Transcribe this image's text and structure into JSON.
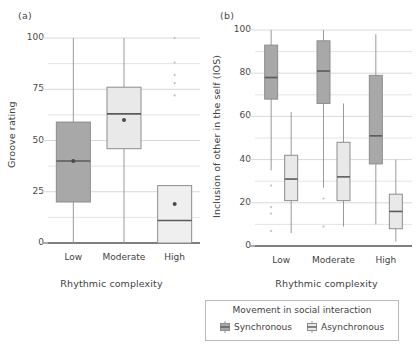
{
  "figure": {
    "panels": [
      {
        "label": "(a)",
        "ylabel": "Groove rating",
        "xlabel": "Rhythmic complexity"
      },
      {
        "label": "(b)",
        "ylabel": "Inclusion of other in the self (IOS)",
        "xlabel": "Rhythmic complexity"
      }
    ]
  },
  "legend": {
    "title": "Movement in social interaction",
    "entries": [
      {
        "label": "Synchronous",
        "color": "#a8a8a8"
      },
      {
        "label": "Asynchronous",
        "color": "#e8e8e8"
      }
    ]
  },
  "colors": {
    "synchronous_fill": "#a8a8a8",
    "asynchronous_fill": "#e9e9e9",
    "box_stroke": "#8d8d8d",
    "median_stroke": "#5a5a5a",
    "whisker_stroke": "#9a9a9a",
    "grid": "#d9d9d9",
    "axis": "#555555"
  },
  "chart_data": [
    {
      "type": "box",
      "panel": "(a)",
      "title": "",
      "xlabel": "Rhythmic complexity",
      "ylabel": "Groove rating",
      "categories": [
        "Low",
        "Moderate",
        "High"
      ],
      "ylim": [
        0,
        100
      ],
      "yticks": [
        0,
        25,
        50,
        75,
        100
      ],
      "ytick_labels": [
        "0",
        "25",
        "50",
        "75",
        "100"
      ],
      "minor_gridlines": [
        12.5,
        37.5,
        62.5,
        87.5
      ],
      "grid": true,
      "legend_position": "below-figure",
      "series": [
        {
          "name": "Groove rating",
          "boxes": [
            {
              "category": "Low",
              "fill": "#a8a8a8",
              "whisker_low": 0,
              "q1": 20,
              "median": 40,
              "q3": 59,
              "whisker_high": 100,
              "mean": 40,
              "outliers": []
            },
            {
              "category": "Moderate",
              "fill": "#e9e9e9",
              "whisker_low": 0,
              "q1": 46,
              "median": 63,
              "q3": 76,
              "whisker_high": 100,
              "mean": 60,
              "outliers": []
            },
            {
              "category": "High",
              "fill": "#efefef",
              "whisker_low": 0,
              "q1": 0,
              "median": 11,
              "q3": 28,
              "whisker_high": 28,
              "mean": 19,
              "outliers": [
                100,
                88,
                82,
                78,
                72
              ]
            }
          ]
        }
      ]
    },
    {
      "type": "box",
      "panel": "(b)",
      "title": "",
      "xlabel": "Rhythmic complexity",
      "ylabel": "Inclusion of other in the self (IOS)",
      "categories": [
        "Low",
        "Moderate",
        "High"
      ],
      "ylim": [
        0,
        100
      ],
      "yticks": [
        0,
        20,
        40,
        60,
        80,
        100
      ],
      "ytick_labels": [
        "0",
        "20",
        "40",
        "60",
        "80",
        "100"
      ],
      "minor_gridlines": [
        10,
        30,
        50,
        70,
        90
      ],
      "grid": true,
      "legend_position": "below-figure",
      "series": [
        {
          "name": "Synchronous",
          "fill": "#a8a8a8",
          "boxes": [
            {
              "category": "Low",
              "whisker_low": 35,
              "q1": 68,
              "median": 78,
              "q3": 93,
              "whisker_high": 100,
              "outliers": [
                28,
                18,
                15,
                7
              ]
            },
            {
              "category": "Moderate",
              "whisker_low": 27,
              "q1": 66,
              "median": 81,
              "q3": 95,
              "whisker_high": 100,
              "outliers": [
                22,
                9
              ]
            },
            {
              "category": "High",
              "whisker_low": 10,
              "q1": 38,
              "median": 51,
              "q3": 79,
              "whisker_high": 98,
              "outliers": []
            }
          ]
        },
        {
          "name": "Asynchronous",
          "fill": "#e9e9e9",
          "boxes": [
            {
              "category": "Low",
              "whisker_low": 6,
              "q1": 21,
              "median": 31,
              "q3": 42,
              "whisker_high": 62,
              "outliers": []
            },
            {
              "category": "Moderate",
              "whisker_low": 9,
              "q1": 21,
              "median": 32,
              "q3": 48,
              "whisker_high": 66,
              "outliers": []
            },
            {
              "category": "High",
              "whisker_low": 2,
              "q1": 8,
              "median": 16,
              "q3": 24,
              "whisker_high": 40,
              "outliers": []
            }
          ]
        }
      ]
    }
  ]
}
